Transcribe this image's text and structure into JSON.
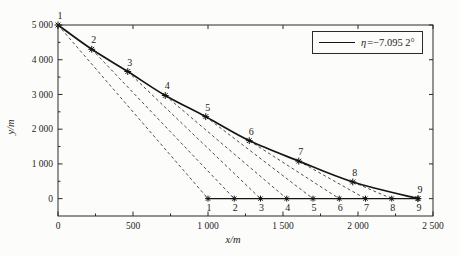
{
  "chart_data": {
    "type": "line",
    "title": "",
    "xlabel": "x/m",
    "ylabel": "y/m",
    "xlim": [
      0,
      2500
    ],
    "ylim": [
      -500,
      5000
    ],
    "grid": false,
    "xticks": {
      "values": [
        0,
        500,
        1000,
        1500,
        2000,
        2500
      ],
      "labels": [
        "0",
        "500",
        "1 000",
        "1 500",
        "2 000",
        "2 500"
      ],
      "minor_values": [
        250,
        750,
        1250,
        1750,
        2250
      ]
    },
    "yticks": {
      "values": [
        0,
        1000,
        2000,
        3000,
        4000,
        5000
      ],
      "labels": [
        "0",
        "1 000",
        "2 000",
        "3 000",
        "4 000",
        "5 000"
      ],
      "minor_values": [
        500,
        1500,
        2500,
        3500,
        4500
      ]
    },
    "legend": {
      "position": "top-right",
      "symbol": "η",
      "value": "=−7.095 2°",
      "line_style": "solid"
    },
    "series": [
      {
        "name": "glide-trajectory",
        "style": "solid",
        "marker": "asterisk",
        "points": [
          [
            0,
            5000
          ],
          [
            225,
            4300
          ],
          [
            465,
            3660
          ],
          [
            715,
            2970
          ],
          [
            985,
            2360
          ],
          [
            1275,
            1670
          ],
          [
            1605,
            1080
          ],
          [
            1965,
            480
          ],
          [
            2400,
            0
          ]
        ],
        "point_labels": [
          "1",
          "2",
          "3",
          "4",
          "5",
          "6",
          "7",
          "8",
          "9"
        ],
        "label_side": "above"
      },
      {
        "name": "touchdown-track",
        "style": "solid",
        "marker": "asterisk",
        "points": [
          [
            1000,
            0
          ],
          [
            1175,
            0
          ],
          [
            1350,
            0
          ],
          [
            1525,
            0
          ],
          [
            1700,
            0
          ],
          [
            1875,
            0
          ],
          [
            2050,
            0
          ],
          [
            2225,
            0
          ],
          [
            2400,
            0
          ]
        ],
        "point_labels": [
          "1",
          "2",
          "3",
          "4",
          "5",
          "6",
          "7",
          "8",
          "9"
        ],
        "label_side": "below"
      }
    ],
    "connectors": {
      "style": "dashed",
      "description": "dashed straight glide line from trajectory point k to touchdown point k",
      "pairs": [
        [
          0,
          0
        ],
        [
          1,
          1
        ],
        [
          2,
          2
        ],
        [
          3,
          3
        ],
        [
          4,
          4
        ],
        [
          5,
          5
        ],
        [
          6,
          6
        ],
        [
          7,
          7
        ]
      ]
    },
    "colors": {
      "line": "#151515",
      "dashed": "#3a3a3a",
      "axis": "#2a2a2a",
      "background": "#fcfcfa"
    }
  }
}
